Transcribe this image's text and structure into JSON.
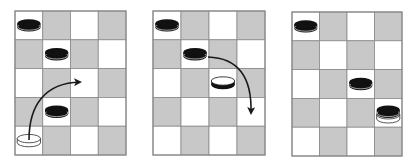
{
  "diagram": {
    "colors": {
      "light_square": "#ffffff",
      "dark_square": "#c8c8c8",
      "grid_line": "#8a8a8a",
      "black_piece": "#111111",
      "white_piece": "#ffffff",
      "arrow": "#1a1a1a"
    },
    "grid": {
      "cols": 4,
      "rows": 5
    },
    "boards": [
      {
        "id": "board-1",
        "x": 15,
        "y": 11,
        "w": 111,
        "h": 144,
        "pieces": [
          {
            "row": 0,
            "col": 0,
            "type": "black"
          },
          {
            "row": 1,
            "col": 1,
            "type": "black"
          },
          {
            "row": 3,
            "col": 1,
            "type": "black"
          },
          {
            "row": 4,
            "col": 0,
            "type": "white-outline"
          }
        ],
        "arrow": {
          "path": "M29,140 C29,105 45,83 80,82",
          "head": [
            80,
            82
          ],
          "direction": "right"
        }
      },
      {
        "id": "board-2",
        "x": 153,
        "y": 11,
        "w": 112,
        "h": 144,
        "pieces": [
          {
            "row": 0,
            "col": 0,
            "type": "black"
          },
          {
            "row": 1,
            "col": 1,
            "type": "black"
          },
          {
            "row": 2,
            "col": 2,
            "type": "white"
          }
        ],
        "arrow": {
          "path": "M208,57 C240,58 252,80 251,113",
          "head": [
            251,
            113
          ],
          "direction": "down"
        }
      },
      {
        "id": "board-3",
        "x": 292,
        "y": 12,
        "w": 110,
        "h": 144,
        "pieces": [
          {
            "row": 0,
            "col": 0,
            "type": "black"
          },
          {
            "row": 2,
            "col": 2,
            "type": "black"
          },
          {
            "row": 3,
            "col": 3,
            "type": "black-on-white"
          }
        ]
      }
    ]
  }
}
